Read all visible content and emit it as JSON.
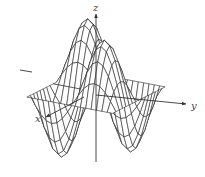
{
  "figure": {
    "type": "3d-wireframe-surface",
    "surface_function": "z = sin(x) * sin(y)",
    "domain": {
      "x": [
        -3.14159,
        3.14159
      ],
      "y": [
        -3.14159,
        3.14159
      ]
    },
    "grid_lines": 16,
    "line_color": "#2a2a2a",
    "background_color": "#ffffff"
  },
  "axes": {
    "x_label": "x",
    "y_label": "y",
    "z_label": "z"
  }
}
